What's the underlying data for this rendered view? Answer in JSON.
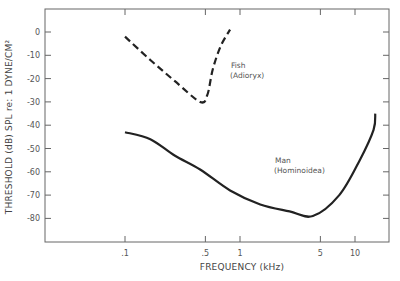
{
  "chart_data": {
    "type": "line",
    "title": "",
    "xlabel": "FREQUENCY (kHz)",
    "ylabel": "THRESHOLD (dB) SPL re: 1 DYNE/CM²",
    "xscale": "log",
    "xlim": [
      0.1,
      17
    ],
    "ylim": [
      -90,
      10
    ],
    "x_ticks": [
      0.1,
      0.5,
      1,
      5,
      10
    ],
    "x_tick_labels": [
      ".1",
      ".5",
      "1",
      "5",
      "10"
    ],
    "y_ticks": [
      0,
      -10,
      -20,
      -30,
      -40,
      -50,
      -60,
      -70,
      -80
    ],
    "y_tick_labels": [
      "0",
      "-10",
      "-20",
      "-30",
      "-40",
      "-50",
      "-60",
      "-70",
      "-80"
    ],
    "grid": false,
    "series": [
      {
        "name": "Fish (Adioryx)",
        "style": "dashed",
        "x": [
          0.1,
          0.166,
          0.27,
          0.45,
          0.52,
          0.58,
          0.68,
          0.82
        ],
        "y": [
          -2,
          -12,
          -21,
          -30,
          -27,
          -16,
          -6,
          1
        ]
      },
      {
        "name": "Man (Hominoidea)",
        "style": "solid",
        "x": [
          0.1,
          0.166,
          0.27,
          0.45,
          0.82,
          1.5,
          2.7,
          4.3,
          7.3,
          11,
          14.5,
          15
        ],
        "y": [
          -43,
          -46,
          -53,
          -59,
          -68,
          -74,
          -77,
          -79,
          -70,
          -55,
          -42,
          -35
        ]
      }
    ],
    "annotations": [
      {
        "text": "Fish",
        "sub": "(Adioryx)",
        "series": 0
      },
      {
        "text": "Man",
        "sub": "(Hominoidea)",
        "series": 1
      }
    ]
  }
}
